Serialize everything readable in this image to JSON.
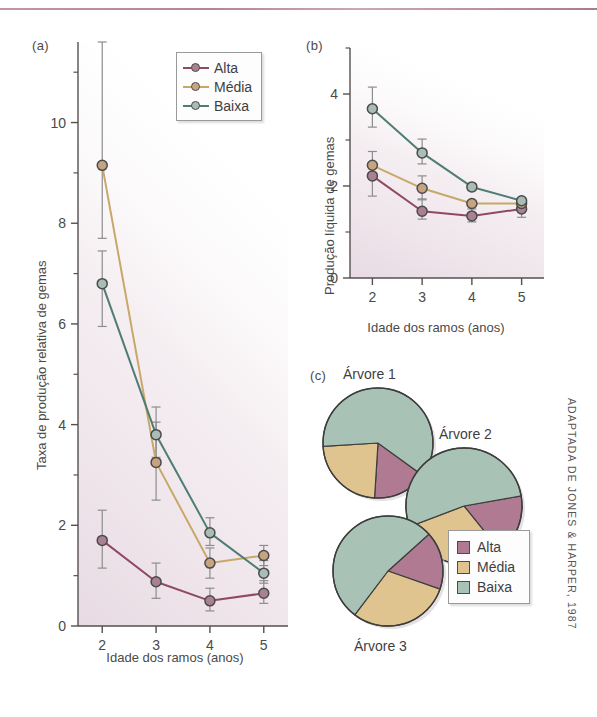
{
  "figure": {
    "credit": "ADAPTADA DE JONES & HARPER, 1987",
    "colors": {
      "alta": "#8e4a63",
      "media": "#c8a86a",
      "baixa": "#4f7d74",
      "alta_fill": "#b07a92",
      "media_fill": "#e0c48f",
      "baixa_fill": "#a9c2b6",
      "axis": "#55504f",
      "rule": "#a86f80"
    }
  },
  "panel_a": {
    "label": "(a)",
    "legend": [
      {
        "label": "Alta",
        "color": "#8e4a63",
        "marker": "#a98192"
      },
      {
        "label": "Média",
        "color": "#c8a86a",
        "marker": "#c6a47f"
      },
      {
        "label": "Baixa",
        "color": "#4f7d74",
        "marker": "#a8bdb4"
      }
    ]
  },
  "panel_b": {
    "label": "(b)"
  },
  "panel_c": {
    "label": "(c)",
    "pies": [
      {
        "title": "Árvore 1"
      },
      {
        "title": "Árvore 2"
      },
      {
        "title": "Árvore 3"
      }
    ],
    "legend": [
      {
        "label": "Alta",
        "color": "#b07a92"
      },
      {
        "label": "Média",
        "color": "#e0c48f"
      },
      {
        "label": "Baixa",
        "color": "#a9c2b6"
      }
    ]
  },
  "chart_data": [
    {
      "id": "a",
      "type": "line",
      "title": "(a)",
      "xlabel": "Idade dos ramos (anos)",
      "ylabel": "Taxa de produção relativa de gemas",
      "x": [
        2,
        3,
        4,
        5
      ],
      "xticks": [
        2,
        3,
        4,
        5
      ],
      "yticks": [
        0,
        2,
        4,
        6,
        8,
        10
      ],
      "yticks_minor": [
        1,
        3,
        5,
        7,
        9,
        11
      ],
      "xlim": [
        1.55,
        5.45
      ],
      "ylim": [
        0,
        11.6
      ],
      "grid": false,
      "legend_position": "top-right",
      "series": [
        {
          "name": "Alta",
          "color": "#8e4a63",
          "values": [
            1.7,
            0.88,
            0.5,
            0.65
          ],
          "err_low": [
            1.15,
            0.55,
            0.3,
            0.45
          ],
          "err_high": [
            2.3,
            1.25,
            0.75,
            0.9
          ]
        },
        {
          "name": "Média",
          "color": "#c8a86a",
          "values": [
            9.15,
            3.25,
            1.25,
            1.4
          ],
          "err_low": [
            7.7,
            2.5,
            0.95,
            1.2
          ],
          "err_high": [
            11.6,
            4.05,
            1.55,
            1.6
          ]
        },
        {
          "name": "Baixa",
          "color": "#4f7d74",
          "values": [
            6.8,
            3.8,
            1.85,
            1.05
          ],
          "err_low": [
            5.95,
            3.35,
            1.6,
            0.85
          ],
          "err_high": [
            7.45,
            4.35,
            2.15,
            1.3
          ]
        }
      ]
    },
    {
      "id": "b",
      "type": "line",
      "title": "(b)",
      "xlabel": "Idade dos ramos (anos)",
      "ylabel": "Produção líquida de gemas",
      "x": [
        2,
        3,
        4,
        5
      ],
      "xticks": [
        2,
        3,
        4,
        5
      ],
      "yticks": [
        0,
        2,
        4
      ],
      "yticks_minor": [
        1,
        3,
        5
      ],
      "xlim": [
        1.55,
        5.45
      ],
      "ylim": [
        0,
        5.0
      ],
      "grid": false,
      "legend_position": "none",
      "series": [
        {
          "name": "Alta",
          "color": "#8e4a63",
          "values": [
            2.22,
            1.45,
            1.35,
            1.5
          ],
          "err_low": [
            1.78,
            1.28,
            1.22,
            1.32
          ],
          "err_high": [
            2.5,
            1.72,
            1.5,
            1.62
          ]
        },
        {
          "name": "Média",
          "color": "#c8a86a",
          "values": [
            2.45,
            1.95,
            1.62,
            1.62
          ],
          "err_low": [
            2.2,
            1.7,
            1.62,
            1.62
          ],
          "err_high": [
            2.75,
            2.22,
            1.62,
            1.62
          ]
        },
        {
          "name": "Baixa",
          "color": "#4f7d74",
          "values": [
            3.68,
            2.72,
            1.98,
            1.68
          ],
          "err_low": [
            3.28,
            2.48,
            1.9,
            1.68
          ],
          "err_high": [
            4.15,
            3.02,
            2.05,
            1.68
          ]
        }
      ]
    },
    {
      "id": "c",
      "type": "pie",
      "title": "(c)",
      "categories": [
        "Alta",
        "Média",
        "Baixa"
      ],
      "colors": [
        "#b07a92",
        "#e0c48f",
        "#a9c2b6"
      ],
      "pies": [
        {
          "name": "Árvore 1",
          "values": [
            16,
            23,
            61
          ],
          "start_angle": 36
        },
        {
          "name": "Árvore 2",
          "values": [
            17,
            30,
            53
          ],
          "start_angle": 350
        },
        {
          "name": "Árvore 3",
          "values": [
            17,
            30,
            53
          ],
          "start_angle": 318
        }
      ]
    }
  ]
}
